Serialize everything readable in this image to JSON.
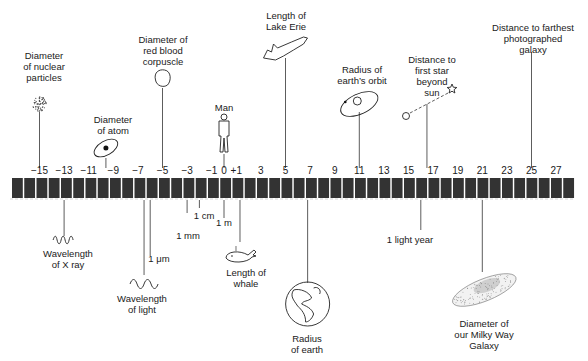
{
  "figure": {
    "scale_unit": "log10(meters)"
  },
  "axis": {
    "ticks": [
      {
        "value": -15,
        "label": "−15"
      },
      {
        "value": -13,
        "label": "−13"
      },
      {
        "value": -11,
        "label": "−11"
      },
      {
        "value": -9,
        "label": "−9"
      },
      {
        "value": -7,
        "label": "−7"
      },
      {
        "value": -5,
        "label": "−5"
      },
      {
        "value": -3,
        "label": "−3"
      },
      {
        "value": -1,
        "label": "−1"
      },
      {
        "value": 0,
        "label": "0"
      },
      {
        "value": 1,
        "label": "+1"
      },
      {
        "value": 3,
        "label": "3"
      },
      {
        "value": 5,
        "label": "5"
      },
      {
        "value": 7,
        "label": "7"
      },
      {
        "value": 9,
        "label": "9"
      },
      {
        "value": 11,
        "label": "11"
      },
      {
        "value": 13,
        "label": "13"
      },
      {
        "value": 15,
        "label": "15"
      },
      {
        "value": 17,
        "label": "17"
      },
      {
        "value": 19,
        "label": "19"
      },
      {
        "value": 21,
        "label": "21"
      },
      {
        "value": 23,
        "label": "23"
      },
      {
        "value": 25,
        "label": "25"
      },
      {
        "value": 27,
        "label": "27"
      }
    ],
    "range": [
      -16,
      28
    ],
    "bar_color": "#333333"
  },
  "above": [
    {
      "id": "nuclear-particles",
      "value": -15,
      "label": "Diameter\nof nuclear\nparticles",
      "icon": "particle-cloud-icon"
    },
    {
      "id": "atom",
      "value": -9.6,
      "label": "Diameter\nof atom",
      "icon": "atom-icon"
    },
    {
      "id": "red-blood-corpuscle",
      "value": -5,
      "label": "Diameter of\nred blood\ncorpuscle",
      "icon": "blood-cell-icon"
    },
    {
      "id": "man",
      "value": 0,
      "label": "Man",
      "icon": "man-icon"
    },
    {
      "id": "lake-erie",
      "value": 5,
      "label": "Length of\nLake Erie",
      "icon": "lake-erie-icon"
    },
    {
      "id": "earth-orbit",
      "value": 11,
      "label": "Radius of\nearth’s orbit",
      "icon": "orbit-icon"
    },
    {
      "id": "first-star",
      "value": 16.5,
      "label": "Distance to\nfirst star\nbeyond\nsun",
      "icon": "star-distance-icon"
    },
    {
      "id": "farthest-galaxy",
      "value": 25,
      "label": "Distance to farthest\nphotographed\ngalaxy",
      "icon": ""
    }
  ],
  "below": [
    {
      "id": "x-ray",
      "value": -13,
      "label": "Wavelength\nof X ray",
      "icon": "short-wave-icon"
    },
    {
      "id": "light",
      "value": -6.5,
      "label": "Wavelength\nof light",
      "icon": "light-wave-icon"
    },
    {
      "id": "micrometer",
      "value": -6,
      "label": "1 μm",
      "icon": ""
    },
    {
      "id": "millimeter",
      "value": -3,
      "label": "1 mm",
      "icon": ""
    },
    {
      "id": "centimeter",
      "value": -2,
      "label": "1 cm",
      "icon": ""
    },
    {
      "id": "meter",
      "value": 0,
      "label": "1 m",
      "icon": ""
    },
    {
      "id": "whale",
      "value": 1.3,
      "label": "Length of\nwhale",
      "icon": "whale-icon"
    },
    {
      "id": "earth",
      "value": 6.8,
      "label": "Radius\nof earth",
      "icon": "earth-icon"
    },
    {
      "id": "light-year",
      "value": 16,
      "label": "1 light year",
      "icon": ""
    },
    {
      "id": "milky-way",
      "value": 21,
      "label": "Diameter of\nour Milky Way\nGalaxy",
      "icon": "galaxy-icon"
    }
  ]
}
